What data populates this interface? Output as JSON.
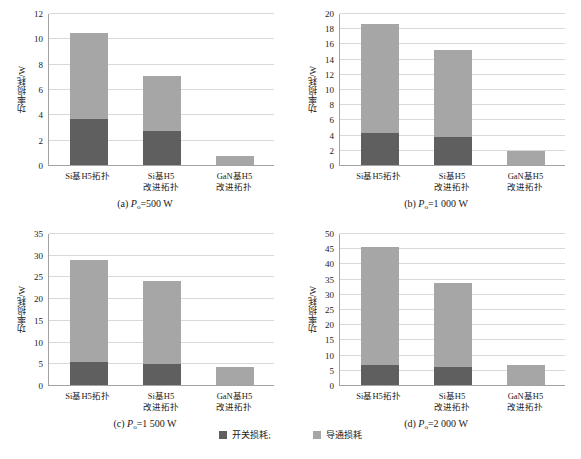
{
  "chart_data": [
    {
      "type": "bar",
      "id": "a",
      "title": "(a) Po=500 W",
      "caption_prefix": "(a) ",
      "caption_var": "P",
      "caption_sub": "o",
      "caption_suffix": "=500 W",
      "xlabel": "",
      "ylabel": "功率损耗/W",
      "ylim": [
        0,
        12
      ],
      "yticks": [
        0,
        2,
        4,
        6,
        8,
        10,
        12
      ],
      "categories": [
        "Si基H5拓扑",
        "Si基H5\n改进拓扑",
        "GaN基H5\n改进拓扑"
      ],
      "series": [
        {
          "name": "开关损耗",
          "values": [
            3.6,
            2.7,
            0.0
          ]
        },
        {
          "name": "导通损耗",
          "values": [
            6.8,
            4.3,
            0.7
          ]
        }
      ],
      "totals": [
        10.4,
        7.0,
        0.7
      ],
      "grid": true,
      "legend_position": "bottom-shared"
    },
    {
      "type": "bar",
      "id": "b",
      "title": "(b) Po=1 000 W",
      "caption_prefix": "(b) ",
      "caption_var": "P",
      "caption_sub": "o",
      "caption_suffix": "=1 000 W",
      "xlabel": "",
      "ylabel": "功率损耗/W",
      "ylim": [
        0,
        20
      ],
      "yticks": [
        0,
        2,
        4,
        6,
        8,
        10,
        12,
        14,
        16,
        18,
        20
      ],
      "categories": [
        "Si基H5拓扑",
        "Si基H5\n改进拓扑",
        "GaN基H5\n改进拓扑"
      ],
      "series": [
        {
          "name": "开关损耗",
          "values": [
            4.2,
            3.7,
            0.0
          ]
        },
        {
          "name": "导通损耗",
          "values": [
            14.3,
            11.5,
            1.8
          ]
        }
      ],
      "totals": [
        18.5,
        15.2,
        1.8
      ],
      "grid": true,
      "legend_position": "bottom-shared"
    },
    {
      "type": "bar",
      "id": "c",
      "title": "(c) Po=1 500 W",
      "caption_prefix": "(c) ",
      "caption_var": "P",
      "caption_sub": "o",
      "caption_suffix": "=1 500 W",
      "xlabel": "",
      "ylabel": "功率损耗/W",
      "ylim": [
        0,
        35
      ],
      "yticks": [
        0,
        5,
        10,
        15,
        20,
        25,
        30,
        35
      ],
      "categories": [
        "Si基H5拓扑",
        "Si基H5\n改进拓扑",
        "GaN基H5\n改进拓扑"
      ],
      "series": [
        {
          "name": "开关损耗",
          "values": [
            5.3,
            4.9,
            0.0
          ]
        },
        {
          "name": "导通损耗",
          "values": [
            23.5,
            19.0,
            4.2
          ]
        }
      ],
      "totals": [
        28.8,
        23.9,
        4.2
      ],
      "grid": true,
      "legend_position": "bottom-shared"
    },
    {
      "type": "bar",
      "id": "d",
      "title": "(d) Po=2 000 W",
      "caption_prefix": "(d) ",
      "caption_var": "P",
      "caption_sub": "o",
      "caption_suffix": "=2 000 W",
      "xlabel": "",
      "ylabel": "功率损耗/W",
      "ylim": [
        0,
        50
      ],
      "yticks": [
        0,
        5,
        10,
        15,
        20,
        25,
        30,
        35,
        40,
        45,
        50
      ],
      "categories": [
        "Si基H5拓扑",
        "Si基H5\n改进拓扑",
        "GaN基H5\n改进拓扑"
      ],
      "series": [
        {
          "name": "开关损耗",
          "values": [
            6.5,
            6.0,
            0.0
          ]
        },
        {
          "name": "导通损耗",
          "values": [
            39.0,
            27.5,
            6.7
          ]
        }
      ],
      "totals": [
        45.5,
        33.5,
        6.7
      ],
      "grid": true,
      "legend_position": "bottom-shared"
    }
  ],
  "legend": {
    "items": [
      {
        "label": "开关损耗;",
        "color": "#5f5f5f",
        "key": "switching-loss"
      },
      {
        "label": "导通损耗",
        "color": "#a6a6a6",
        "key": "conduction-loss"
      }
    ]
  },
  "colors": {
    "switching_loss": "#5f5f5f",
    "conduction_loss": "#a6a6a6",
    "gridline": "#d9d9d9",
    "axis": "#a3a3a3",
    "text": "#1a1a1a",
    "background": "#ffffff"
  }
}
